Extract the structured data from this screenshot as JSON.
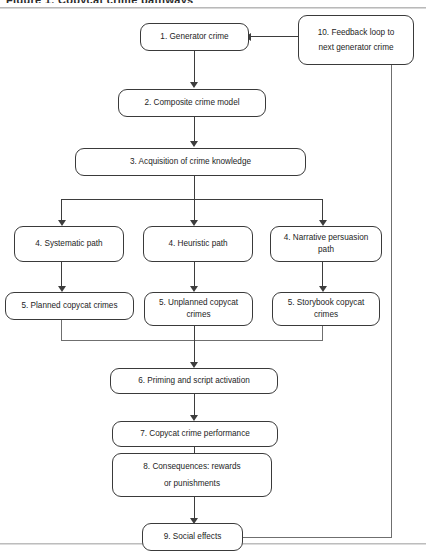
{
  "diagram": {
    "title_clipped": "Figure 1. Copycat crime pathways",
    "nodes": [
      {
        "id": "n1",
        "label": "1. Generator crime"
      },
      {
        "id": "n2",
        "label": "2. Composite crime model"
      },
      {
        "id": "n3",
        "label": "3. Acquisition of crime knowledge"
      },
      {
        "id": "n4a",
        "label": "4. Systematic path"
      },
      {
        "id": "n4b",
        "label": "4. Heuristic path"
      },
      {
        "id": "n4c_line1",
        "label": "4. Narrative persuasion"
      },
      {
        "id": "n4c_line2",
        "label": "path"
      },
      {
        "id": "n5a",
        "label": "5. Planned copycat crimes"
      },
      {
        "id": "n5b_line1",
        "label": "5. Unplanned copycat"
      },
      {
        "id": "n5b_line2",
        "label": "crimes"
      },
      {
        "id": "n5c_line1",
        "label": "5. Storybook copycat"
      },
      {
        "id": "n5c_line2",
        "label": "crimes"
      },
      {
        "id": "n6",
        "label": "6. Priming and script activation"
      },
      {
        "id": "n7",
        "label": "7. Copycat crime performance"
      },
      {
        "id": "n8_line1",
        "label": "8. Consequences: rewards"
      },
      {
        "id": "n8_line2",
        "label": "or punishments"
      },
      {
        "id": "n9",
        "label": "9. Social effects"
      },
      {
        "id": "n10_line1",
        "label": "10. Feedback loop to"
      },
      {
        "id": "n10_line2",
        "label": "next generator crime"
      }
    ],
    "colors": {
      "box_border": "#3a3a3a",
      "connector": "#3d3d3d",
      "text": "#1d1d1d",
      "background": "#ffffff"
    }
  }
}
